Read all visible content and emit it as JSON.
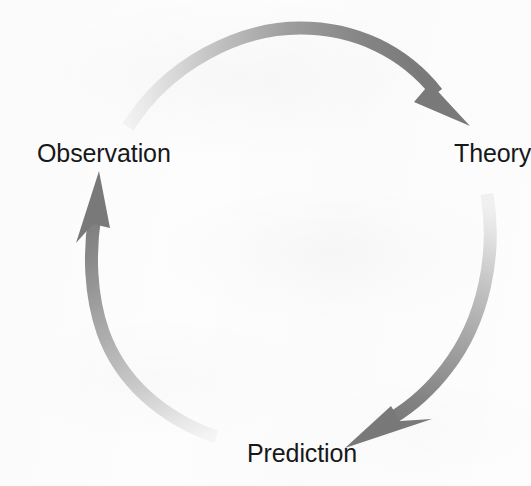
{
  "diagram": {
    "background_color": "#fdfdfd",
    "text_color": "#17181a",
    "arrow_dark_color": "#7c7c7c",
    "arrow_light_color": "#f1f1f1",
    "center": {
      "x": 282,
      "y": 243
    },
    "radius": 165,
    "direction": "clockwise",
    "nodes": [
      {
        "id": "observation",
        "label": "Observation",
        "position": "left",
        "x": 100,
        "y": 155
      },
      {
        "id": "theory",
        "label": "Theory",
        "position": "right",
        "x": 489,
        "y": 155
      },
      {
        "id": "prediction",
        "label": "Prediction",
        "position": "bottom",
        "x": 296,
        "y": 455
      }
    ],
    "arrows": [
      {
        "id": "observation-to-theory",
        "from": "observation",
        "to": "theory",
        "icon": "curved-arrow-icon",
        "arc": "top",
        "gradient_from": "#f2f2f2",
        "gradient_to": "#7c7c7c",
        "head_direction": "down-right"
      },
      {
        "id": "theory-to-prediction",
        "from": "theory",
        "to": "prediction",
        "icon": "curved-arrow-icon",
        "arc": "right",
        "gradient_from": "#efefef",
        "gradient_to": "#7c7c7c",
        "head_direction": "down-left"
      },
      {
        "id": "prediction-to-observation",
        "from": "prediction",
        "to": "observation",
        "icon": "curved-arrow-icon",
        "arc": "left",
        "gradient_from": "#f3f3f3",
        "gradient_to": "#7c7c7c",
        "head_direction": "up"
      }
    ]
  }
}
